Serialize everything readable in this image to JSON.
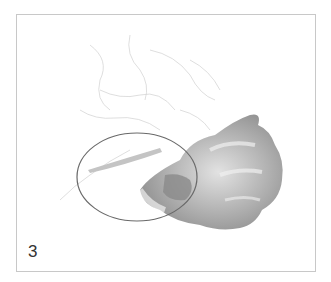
{
  "figure": {
    "step_label": "3",
    "border_color": "#c8c8c8",
    "ellipse_stroke": "#6a6a6a",
    "sketch_color": "#d8d8d8",
    "shading_dark": "#8c8c8c",
    "shading_mid": "#b4b4b4",
    "shading_light": "#dedede"
  }
}
